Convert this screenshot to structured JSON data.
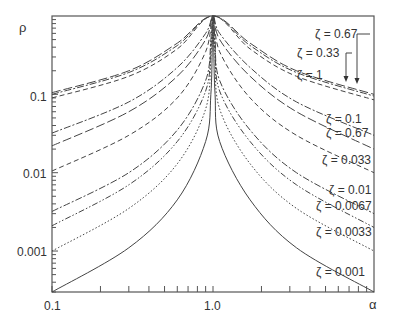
{
  "chart_data": {
    "type": "line",
    "title": "",
    "xlabel": "α",
    "ylabel": "ρ",
    "xscale": "log",
    "yscale": "log",
    "xlim": [
      0.1,
      10
    ],
    "ylim": [
      0.0003,
      1
    ],
    "x_tick_labels": [
      "0.1",
      "1.0"
    ],
    "y_tick_labels": [
      "0.1",
      "0.01",
      "0.001"
    ],
    "grid": false,
    "series": [
      {
        "name": "ζ = 0.67",
        "style": "dash-long",
        "x": [
          0.1,
          0.3,
          0.6,
          1.0,
          1.7,
          3.3,
          10
        ],
        "y": [
          0.105,
          0.2,
          0.45,
          1.0,
          0.45,
          0.2,
          0.1
        ]
      },
      {
        "name": "ζ = 0.33",
        "style": "dash-dot",
        "x": [
          0.1,
          0.3,
          0.6,
          1.0,
          1.7,
          3.3,
          10
        ],
        "y": [
          0.1,
          0.19,
          0.42,
          1.0,
          0.42,
          0.19,
          0.095
        ]
      },
      {
        "name": "ζ = 1",
        "style": "dash",
        "x": [
          0.1,
          0.3,
          0.6,
          1.0,
          1.7,
          3.3,
          10
        ],
        "y": [
          0.09,
          0.17,
          0.38,
          1.0,
          0.38,
          0.17,
          0.085
        ]
      },
      {
        "name": "ζ = 0.1",
        "style": "dash-dot",
        "x": [
          0.1,
          0.3,
          0.6,
          0.9,
          1.0,
          1.1,
          1.7,
          3.3,
          10
        ],
        "y": [
          0.032,
          0.08,
          0.22,
          0.6,
          1.0,
          0.6,
          0.22,
          0.08,
          0.03
        ]
      },
      {
        "name": "ζ = 0.67",
        "style": "dash-long",
        "x": [
          0.1,
          0.3,
          0.6,
          0.9,
          1.0,
          1.1,
          1.7,
          3.3,
          10
        ],
        "y": [
          0.022,
          0.06,
          0.17,
          0.5,
          1.0,
          0.5,
          0.17,
          0.06,
          0.02
        ]
      },
      {
        "name": "ζ = 0.033",
        "style": "dash",
        "x": [
          0.1,
          0.3,
          0.6,
          0.9,
          1.0,
          1.1,
          1.7,
          3.3,
          10
        ],
        "y": [
          0.0105,
          0.03,
          0.09,
          0.35,
          1.0,
          0.35,
          0.09,
          0.03,
          0.01
        ]
      },
      {
        "name": "ζ = 0.01",
        "style": "dash-dot",
        "x": [
          0.1,
          0.3,
          0.6,
          0.9,
          0.97,
          1.0,
          1.03,
          1.1,
          1.7,
          3.3,
          10
        ],
        "y": [
          0.0032,
          0.01,
          0.035,
          0.15,
          0.5,
          1.0,
          0.5,
          0.15,
          0.035,
          0.01,
          0.003
        ]
      },
      {
        "name": "ζ = 0.0067",
        "style": "dash-dot-dot",
        "x": [
          0.1,
          0.3,
          0.6,
          0.9,
          0.97,
          1.0,
          1.03,
          1.1,
          1.7,
          3.3,
          10
        ],
        "y": [
          0.0021,
          0.007,
          0.025,
          0.11,
          0.4,
          1.0,
          0.4,
          0.11,
          0.025,
          0.007,
          0.002
        ]
      },
      {
        "name": "ζ = 0.0033",
        "style": "dot",
        "x": [
          0.1,
          0.3,
          0.6,
          0.9,
          0.97,
          1.0,
          1.03,
          1.1,
          1.7,
          3.3,
          10
        ],
        "y": [
          0.001,
          0.0035,
          0.013,
          0.065,
          0.3,
          1.0,
          0.3,
          0.065,
          0.013,
          0.0035,
          0.001
        ]
      },
      {
        "name": "ζ = 0.001",
        "style": "solid",
        "x": [
          0.1,
          0.3,
          0.6,
          0.9,
          0.97,
          0.99,
          1.0,
          1.01,
          1.03,
          1.1,
          1.7,
          3.3,
          10
        ],
        "y": [
          0.0003,
          0.0011,
          0.0045,
          0.025,
          0.1,
          0.4,
          1.0,
          0.4,
          0.1,
          0.025,
          0.0045,
          0.0011,
          0.0003
        ]
      }
    ],
    "annotations": [
      {
        "text": "ζ = 0.67",
        "x_px": 315,
        "y_px": 28,
        "arrow_to": [
          357,
          84
        ]
      },
      {
        "text": "ζ = 0.33",
        "x_px": 297,
        "y_px": 47,
        "arrow_to": [
          346,
          82
        ]
      },
      {
        "text": "ζ = 1",
        "x_px": 297,
        "y_px": 69
      },
      {
        "text": "ζ = 0.1",
        "x_px": 326,
        "y_px": 113
      },
      {
        "text": "ζ = 0.67",
        "x_px": 326,
        "y_px": 127
      },
      {
        "text": "ζ = 0.033",
        "x_px": 322,
        "y_px": 154
      },
      {
        "text": "ζ = 0.01",
        "x_px": 329,
        "y_px": 184
      },
      {
        "text": "ζ = 0.0067",
        "x_px": 316,
        "y_px": 200
      },
      {
        "text": "ζ = 0.0033",
        "x_px": 316,
        "y_px": 226
      },
      {
        "text": "ζ = 0.001",
        "x_px": 316,
        "y_px": 266
      }
    ]
  }
}
